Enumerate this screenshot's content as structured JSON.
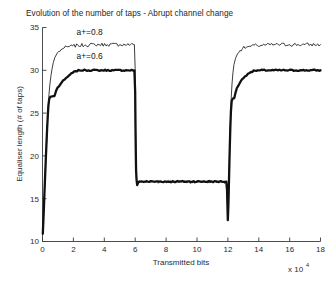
{
  "chart_data": {
    "type": "line",
    "title": "Evolution of the number of taps - Abrupt channel change",
    "xlabel": "Transmitted bits",
    "ylabel": "Equaliser length (# of taps)",
    "x_exponent_base": "x 10",
    "x_exponent_power": "4",
    "xlim": [
      0,
      18
    ],
    "ylim": [
      10,
      35
    ],
    "xticks": [
      0,
      2,
      4,
      6,
      8,
      10,
      12,
      14,
      16,
      18
    ],
    "yticks": [
      10,
      15,
      20,
      25,
      30,
      35
    ],
    "xtick_labels": [
      "0",
      "2",
      "4",
      "6",
      "8",
      "10",
      "12",
      "14",
      "16",
      "18"
    ],
    "ytick_labels": [
      "10",
      "15",
      "20",
      "25",
      "30",
      "35"
    ],
    "grid": false,
    "legend_position": "in-plot annotations",
    "annotations": [
      {
        "text": "a+=0.8",
        "x": 3.05,
        "y": 34.15,
        "series": "thin"
      },
      {
        "text": "a+=0.6",
        "x": 3.05,
        "y": 31.35,
        "series": "thick"
      }
    ],
    "series": [
      {
        "name": "a+=0.8",
        "style": "thin",
        "points": [
          [
            0.02,
            10.9
          ],
          [
            0.06,
            12.6
          ],
          [
            0.1,
            14.4
          ],
          [
            0.14,
            16.2
          ],
          [
            0.18,
            18.0
          ],
          [
            0.22,
            19.7
          ],
          [
            0.26,
            21.3
          ],
          [
            0.3,
            23.0
          ],
          [
            0.34,
            24.6
          ],
          [
            0.38,
            26.0
          ],
          [
            0.42,
            27.2
          ],
          [
            0.48,
            28.4
          ],
          [
            0.55,
            29.4
          ],
          [
            0.62,
            30.2
          ],
          [
            0.7,
            30.9
          ],
          [
            0.8,
            31.5
          ],
          [
            0.92,
            31.9
          ],
          [
            1.05,
            32.2
          ],
          [
            1.2,
            32.4
          ],
          [
            1.4,
            32.6
          ],
          [
            1.65,
            32.75
          ],
          [
            1.95,
            32.85
          ],
          [
            2.3,
            32.9
          ],
          [
            2.8,
            32.95
          ],
          [
            3.4,
            33.0
          ],
          [
            4.2,
            33.0
          ],
          [
            5.0,
            33.0
          ],
          [
            5.7,
            33.0
          ],
          [
            5.95,
            33.0
          ],
          [
            6.0,
            30.2
          ],
          [
            6.02,
            24.0
          ],
          [
            6.05,
            19.5
          ],
          [
            6.08,
            17.4
          ],
          [
            6.12,
            16.6
          ],
          [
            6.18,
            16.9
          ],
          [
            6.3,
            17.0
          ],
          [
            7.0,
            17.0
          ],
          [
            8.5,
            17.0
          ],
          [
            10.0,
            17.0
          ],
          [
            11.5,
            17.0
          ],
          [
            11.9,
            17.0
          ],
          [
            11.95,
            16.2
          ],
          [
            11.98,
            14.0
          ],
          [
            12.0,
            12.6
          ],
          [
            12.03,
            13.8
          ],
          [
            12.06,
            16.4
          ],
          [
            12.1,
            19.5
          ],
          [
            12.14,
            22.4
          ],
          [
            12.18,
            24.8
          ],
          [
            12.22,
            26.8
          ],
          [
            12.27,
            28.4
          ],
          [
            12.33,
            29.7
          ],
          [
            12.4,
            30.7
          ],
          [
            12.5,
            31.4
          ],
          [
            12.62,
            31.9
          ],
          [
            12.78,
            32.3
          ],
          [
            12.95,
            32.55
          ],
          [
            13.2,
            32.7
          ],
          [
            13.5,
            32.8
          ],
          [
            13.9,
            32.9
          ],
          [
            14.4,
            32.95
          ],
          [
            15.0,
            33.0
          ],
          [
            16.0,
            33.0
          ],
          [
            17.0,
            33.0
          ],
          [
            18.0,
            33.0
          ]
        ]
      },
      {
        "name": "a+=0.6",
        "style": "thick",
        "points": [
          [
            0.02,
            10.9
          ],
          [
            0.06,
            12.6
          ],
          [
            0.1,
            14.4
          ],
          [
            0.14,
            16.3
          ],
          [
            0.18,
            18.1
          ],
          [
            0.22,
            19.9
          ],
          [
            0.26,
            21.6
          ],
          [
            0.3,
            23.2
          ],
          [
            0.34,
            24.6
          ],
          [
            0.38,
            25.8
          ],
          [
            0.43,
            26.6
          ],
          [
            0.5,
            26.9
          ],
          [
            0.62,
            26.95
          ],
          [
            0.78,
            27.0
          ],
          [
            0.88,
            27.6
          ],
          [
            0.98,
            28.0
          ],
          [
            1.1,
            28.2
          ],
          [
            1.25,
            28.6
          ],
          [
            1.42,
            28.9
          ],
          [
            1.6,
            29.2
          ],
          [
            1.78,
            29.5
          ],
          [
            1.95,
            29.7
          ],
          [
            2.15,
            29.9
          ],
          [
            2.4,
            30.0
          ],
          [
            2.8,
            30.0
          ],
          [
            3.6,
            30.0
          ],
          [
            4.6,
            30.0
          ],
          [
            5.5,
            30.0
          ],
          [
            5.95,
            30.0
          ],
          [
            6.0,
            27.5
          ],
          [
            6.02,
            23.5
          ],
          [
            6.04,
            20.5
          ],
          [
            6.06,
            18.3
          ],
          [
            6.09,
            17.2
          ],
          [
            6.13,
            16.6
          ],
          [
            6.2,
            16.9
          ],
          [
            6.35,
            17.0
          ],
          [
            7.2,
            17.0
          ],
          [
            8.8,
            17.0
          ],
          [
            10.4,
            17.0
          ],
          [
            11.6,
            17.0
          ],
          [
            11.9,
            17.0
          ],
          [
            11.95,
            16.0
          ],
          [
            11.98,
            13.8
          ],
          [
            12.0,
            12.5
          ],
          [
            12.04,
            14.5
          ],
          [
            12.08,
            17.6
          ],
          [
            12.12,
            20.6
          ],
          [
            12.16,
            23.2
          ],
          [
            12.2,
            25.2
          ],
          [
            12.25,
            26.4
          ],
          [
            12.32,
            26.7
          ],
          [
            12.42,
            26.75
          ],
          [
            12.5,
            27.4
          ],
          [
            12.58,
            27.9
          ],
          [
            12.68,
            28.2
          ],
          [
            12.8,
            28.6
          ],
          [
            12.95,
            29.0
          ],
          [
            13.12,
            29.3
          ],
          [
            13.3,
            29.6
          ],
          [
            13.5,
            29.8
          ],
          [
            13.75,
            29.95
          ],
          [
            14.1,
            30.0
          ],
          [
            14.8,
            30.0
          ],
          [
            15.8,
            30.0
          ],
          [
            16.8,
            30.0
          ],
          [
            18.0,
            30.0
          ]
        ]
      }
    ]
  }
}
